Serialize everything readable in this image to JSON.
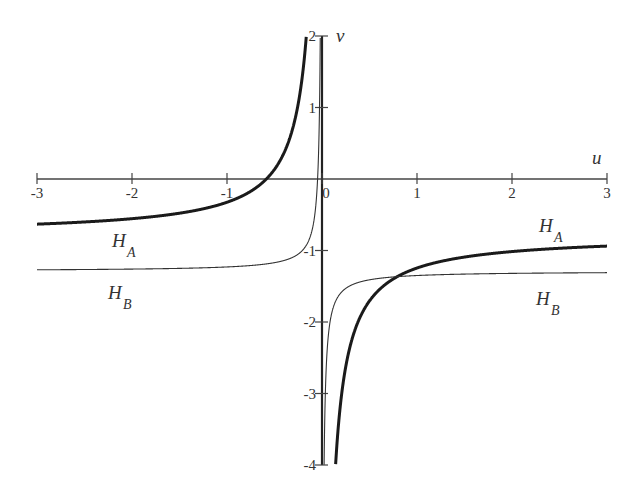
{
  "chart_data": {
    "type": "line",
    "title": "",
    "xlabel": "u",
    "ylabel": "v",
    "xlim": [
      -3,
      3
    ],
    "ylim": [
      -4,
      2
    ],
    "grid": false,
    "x_ticks": [
      -3,
      -2,
      -1,
      0,
      1,
      2,
      3
    ],
    "x_tick_labels": [
      "-3",
      "-2",
      "-1",
      "0",
      "1",
      "2",
      "3"
    ],
    "y_ticks": [
      2,
      1,
      -1,
      -2,
      -3,
      -4
    ],
    "y_tick_labels": [
      "2",
      "1",
      "-1",
      "-2",
      "-3",
      "-4"
    ],
    "series": [
      {
        "name": "H_A",
        "style": "thick",
        "model": "v = -0.785 - 0.46/u",
        "points": [
          [
            -3,
            -0.63
          ],
          [
            -2,
            -0.56
          ],
          [
            -1,
            -0.33
          ],
          [
            -0.6,
            0.0
          ],
          [
            -0.4,
            0.37
          ],
          [
            -0.25,
            1.05
          ],
          [
            -0.17,
            1.92
          ],
          [
            0.2,
            -3.1
          ],
          [
            0.3,
            -2.32
          ],
          [
            0.5,
            -1.71
          ],
          [
            0.8,
            -1.36
          ],
          [
            1,
            -1.25
          ],
          [
            2,
            -1.02
          ],
          [
            3,
            -0.94
          ]
        ]
      },
      {
        "name": "H_B",
        "style": "thin",
        "model": "v = -1.29 - 0.06/u",
        "points": [
          [
            -3,
            -1.27
          ],
          [
            -2,
            -1.26
          ],
          [
            -1,
            -1.23
          ],
          [
            -0.5,
            -1.17
          ],
          [
            -0.2,
            -0.99
          ],
          [
            -0.1,
            -0.69
          ],
          [
            -0.05,
            -0.09
          ],
          [
            -0.02,
            1.71
          ],
          [
            0.02,
            -4.29
          ],
          [
            0.05,
            -2.49
          ],
          [
            0.1,
            -1.89
          ],
          [
            0.3,
            -1.49
          ],
          [
            0.8,
            -1.37
          ],
          [
            1,
            -1.35
          ],
          [
            2,
            -1.32
          ],
          [
            3,
            -1.31
          ]
        ]
      }
    ],
    "annotations": [
      {
        "text": "H",
        "sub": "A",
        "near": "left branch of H_A",
        "u": -2.2,
        "v": -0.85
      },
      {
        "text": "H",
        "sub": "B",
        "near": "left branch of H_B",
        "u": -2.25,
        "v": -1.6
      },
      {
        "text": "H",
        "sub": "A",
        "near": "right branch of H_A",
        "u": 2.2,
        "v": -0.65
      },
      {
        "text": "H",
        "sub": "B",
        "near": "right branch of H_B",
        "u": 2.2,
        "v": -1.65
      }
    ],
    "legend": "none (inline labels)"
  },
  "labels": {
    "x_axis_name": "u",
    "y_axis_name": "v",
    "curve_a_main": "H",
    "curve_a_sub": "A",
    "curve_b_main": "H",
    "curve_b_sub": "B"
  }
}
